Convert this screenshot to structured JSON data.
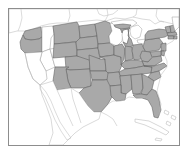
{
  "figure": {
    "kind": "thematic-map",
    "region": "United States",
    "width": 189,
    "height": 162
  },
  "colors": {
    "page_background": "#ffffff",
    "frame_border": "#8d8d8d",
    "map_background": "#ffffff",
    "shaded_fill": "#a9a9a9",
    "shaded_stroke": "#5e5e5e",
    "plain_fill": "#ffffff",
    "plain_stroke": "#9a9a9a",
    "neighbor_stroke": "#b4b4b4"
  },
  "frame": {
    "x": 8,
    "y": 8,
    "width": 172,
    "height": 138,
    "border_width": 1
  },
  "legend": {
    "shaded_meaning": "included",
    "plain_meaning": "not included"
  },
  "map": {
    "shaded_states": [
      "Washington",
      "Oregon",
      "Montana",
      "North Dakota",
      "South Dakota",
      "Wyoming",
      "Colorado",
      "Nebraska",
      "Kansas",
      "Minnesota",
      "Iowa",
      "Missouri",
      "Oklahoma",
      "Texas",
      "Arkansas",
      "Louisiana",
      "Mississippi",
      "Alabama",
      "Georgia",
      "Florida",
      "Tennessee",
      "Kentucky",
      "Illinois",
      "Indiana",
      "Ohio",
      "Michigan",
      "West Virginia",
      "Virginia",
      "North Carolina",
      "South Carolina",
      "Pennsylvania",
      "New York",
      "New Jersey",
      "Maryland",
      "Delaware",
      "Connecticut",
      "Rhode Island",
      "Massachusetts",
      "Vermont",
      "New Hampshire",
      "New Mexico",
      "Arizona"
    ],
    "plain_states": [
      "California",
      "Nevada",
      "Utah",
      "Idaho",
      "Wisconsin",
      "Maine"
    ],
    "neighbors": [
      "Canada",
      "Mexico",
      "Cuba",
      "Bahamas"
    ],
    "lakes": [
      "Lake Superior",
      "Lake Michigan",
      "Lake Huron",
      "Lake Erie",
      "Lake Ontario"
    ]
  }
}
